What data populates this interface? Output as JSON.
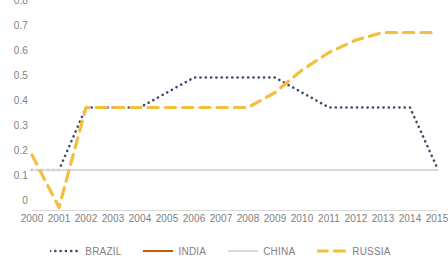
{
  "chart_data": {
    "type": "line",
    "title": "",
    "xlabel": "",
    "ylabel": "",
    "grid": false,
    "legend_position": "bottom",
    "x": [
      2000,
      2001,
      2002,
      2003,
      2004,
      2005,
      2006,
      2007,
      2008,
      2009,
      2010,
      2011,
      2012,
      2013,
      2014,
      2015
    ],
    "categories": [
      "2000",
      "2001",
      "2002",
      "2003",
      "2004",
      "2005",
      "2006",
      "2007",
      "2008",
      "2009",
      "2010",
      "2011",
      "2012",
      "2013",
      "2014",
      "2015"
    ],
    "ylim": [
      0,
      0.8
    ],
    "yticks": [
      0,
      0.1,
      0.2,
      0.3,
      0.4,
      0.5,
      0.6,
      0.7,
      0.8
    ],
    "ytick_labels": [
      "0",
      "0.1",
      "0.2",
      "0.3",
      "0.4",
      "0.5",
      "0.6",
      "0.7",
      "0.8"
    ],
    "series": [
      {
        "name": "BRAZIL",
        "color": "#3b4a6b",
        "style": "dotted",
        "values": [
          0.16,
          0.16,
          0.41,
          0.41,
          0.41,
          0.47,
          0.53,
          0.53,
          0.53,
          0.53,
          0.47,
          0.41,
          0.41,
          0.41,
          0.41,
          0.17
        ]
      },
      {
        "name": "INDIA",
        "color": "#c55a11",
        "style": "solid",
        "values": [
          0.16,
          0.16,
          0.16,
          0.16,
          0.16,
          0.16,
          0.16,
          0.16,
          0.16,
          0.16,
          0.16,
          0.16,
          0.16,
          0.16,
          0.16,
          0.16
        ]
      },
      {
        "name": "CHINA",
        "color": "#d9d9d9",
        "style": "solid",
        "values": [
          0.16,
          0.16,
          0.16,
          0.16,
          0.16,
          0.16,
          0.16,
          0.16,
          0.16,
          0.16,
          0.16,
          0.16,
          0.16,
          0.16,
          0.16,
          0.16
        ]
      },
      {
        "name": "RUSSIA",
        "color": "#f2bf3f",
        "style": "dashed",
        "values": [
          0.22,
          0.01,
          0.41,
          0.41,
          0.41,
          0.41,
          0.41,
          0.41,
          0.41,
          0.47,
          0.56,
          0.63,
          0.68,
          0.71,
          0.71,
          0.71
        ]
      }
    ]
  },
  "legend": {
    "items": [
      {
        "label": "BRAZIL",
        "color": "#3b4a6b",
        "style": "dotted"
      },
      {
        "label": "INDIA",
        "color": "#c55a11",
        "style": "solid"
      },
      {
        "label": "CHINA",
        "color": "#d9d9d9",
        "style": "solid"
      },
      {
        "label": "RUSSIA",
        "color": "#f2bf3f",
        "style": "dashed"
      }
    ]
  },
  "axis": {
    "color": "#d9d9d9",
    "tick_label_color": "#808080"
  }
}
